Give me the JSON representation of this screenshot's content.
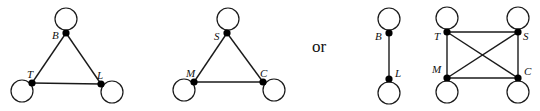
{
  "diagram": {
    "connector_text": "or",
    "graphs": [
      {
        "id": "triangle-BTL",
        "nodes": [
          {
            "id": "B",
            "label": "B",
            "x": 66,
            "y": 33,
            "loop": {
              "cx": 66,
              "cy": 19,
              "r": 11
            },
            "lx": 52,
            "ly": 39
          },
          {
            "id": "T",
            "label": "T",
            "x": 32,
            "y": 83,
            "loop": {
              "cx": 22,
              "cy": 91,
              "r": 11
            },
            "lx": 27,
            "ly": 78
          },
          {
            "id": "L",
            "label": "L",
            "x": 101,
            "y": 84,
            "loop": {
              "cx": 112,
              "cy": 92,
              "r": 11
            },
            "lx": 97,
            "ly": 79
          }
        ],
        "edges": [
          [
            "B",
            "T"
          ],
          [
            "B",
            "L"
          ],
          [
            "T",
            "L"
          ]
        ]
      },
      {
        "id": "triangle-SMC",
        "nodes": [
          {
            "id": "S",
            "label": "S",
            "x": 227,
            "y": 33,
            "loop": {
              "cx": 228,
              "cy": 19,
              "r": 11
            },
            "lx": 214,
            "ly": 40
          },
          {
            "id": "M",
            "label": "M",
            "x": 194,
            "y": 82,
            "loop": {
              "cx": 184,
              "cy": 90,
              "r": 11
            },
            "lx": 186,
            "ly": 77
          },
          {
            "id": "C",
            "label": "C",
            "x": 263,
            "y": 82,
            "loop": {
              "cx": 274,
              "cy": 90,
              "r": 11
            },
            "lx": 260,
            "ly": 77
          }
        ],
        "edges": [
          [
            "S",
            "M"
          ],
          [
            "S",
            "C"
          ],
          [
            "M",
            "C"
          ]
        ]
      },
      {
        "id": "pair-BL",
        "nodes": [
          {
            "id": "B",
            "label": "B",
            "x": 389,
            "y": 33,
            "loop": {
              "cx": 389,
              "cy": 19,
              "r": 11
            },
            "lx": 375,
            "ly": 40
          },
          {
            "id": "L",
            "label": "L",
            "x": 389,
            "y": 79,
            "loop": {
              "cx": 389,
              "cy": 93,
              "r": 11
            },
            "lx": 395,
            "ly": 77
          }
        ],
        "edges": [
          [
            "B",
            "L"
          ]
        ]
      },
      {
        "id": "square-TSMC",
        "nodes": [
          {
            "id": "T",
            "label": "T",
            "x": 447,
            "y": 32,
            "loop": {
              "cx": 447,
              "cy": 18,
              "r": 11
            },
            "lx": 434,
            "ly": 40
          },
          {
            "id": "S",
            "label": "S",
            "x": 518,
            "y": 32,
            "loop": {
              "cx": 518,
              "cy": 18,
              "r": 11
            },
            "lx": 523,
            "ly": 40
          },
          {
            "id": "M",
            "label": "M",
            "x": 447,
            "y": 78,
            "loop": {
              "cx": 447,
              "cy": 92,
              "r": 11
            },
            "lx": 432,
            "ly": 73
          },
          {
            "id": "C",
            "label": "C",
            "x": 518,
            "y": 78,
            "loop": {
              "cx": 518,
              "cy": 92,
              "r": 11
            },
            "lx": 524,
            "ly": 75
          }
        ],
        "edges": [
          [
            "T",
            "S"
          ],
          [
            "T",
            "M"
          ],
          [
            "S",
            "C"
          ],
          [
            "M",
            "C"
          ],
          [
            "T",
            "C"
          ],
          [
            "S",
            "M"
          ]
        ]
      }
    ],
    "or_position": {
      "x": 312,
      "y": 52
    }
  }
}
